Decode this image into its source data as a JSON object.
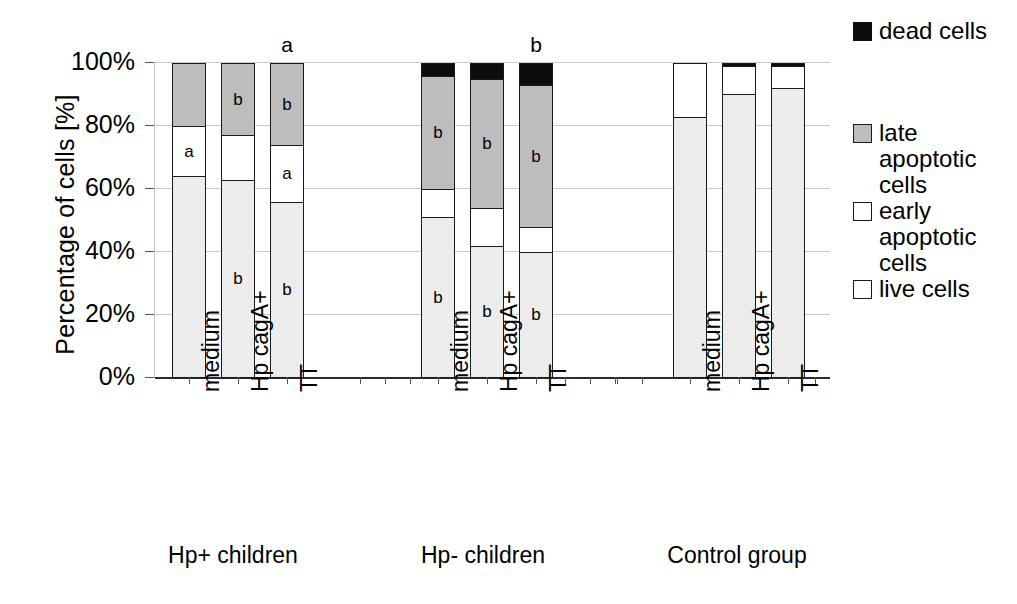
{
  "chart_data": {
    "type": "bar",
    "subtype": "stacked-percent",
    "title": "",
    "xlabel": "",
    "ylabel": "Percentage of cells [%]",
    "ylim": [
      0,
      100
    ],
    "ytick_labels": [
      "0%",
      "20%",
      "40%",
      "60%",
      "80%",
      "100%"
    ],
    "ytick_values": [
      0,
      20,
      40,
      60,
      80,
      100
    ],
    "grid": true,
    "legend_position": "right",
    "categories": [
      "medium",
      "Hp cagA+",
      "TT",
      "medium",
      "Hp cagA+",
      "TT",
      "medium",
      "Hp cagA+",
      "TT"
    ],
    "groups": [
      {
        "label": "Hp+ children",
        "categories": [
          "medium",
          "Hp cagA+",
          "TT"
        ]
      },
      {
        "label": "Hp- children",
        "categories": [
          "medium",
          "Hp cagA+",
          "TT"
        ]
      },
      {
        "label": "Control group",
        "categories": [
          "medium",
          "Hp cagA+",
          "TT"
        ]
      }
    ],
    "series": [
      {
        "name": "live cells",
        "key": "live",
        "color": "#ececec",
        "values": [
          64,
          63,
          56,
          51,
          42,
          40,
          83,
          90,
          92
        ]
      },
      {
        "name": "early apoptotic cells",
        "key": "early",
        "color": "#ffffff",
        "values": [
          16,
          14,
          18,
          9,
          12,
          8,
          17,
          9,
          7
        ]
      },
      {
        "name": "late apoptotic cells",
        "key": "late",
        "color": "#bdbdbd",
        "values": [
          20,
          23,
          26,
          36,
          41,
          45,
          0,
          0,
          0
        ]
      },
      {
        "name": "dead cells",
        "key": "dead",
        "color": "#0d0d0d",
        "values": [
          0,
          0,
          0,
          4,
          5,
          7,
          0,
          1,
          1
        ]
      }
    ],
    "annotations": {
      "bar_top_labels": [
        "",
        "",
        "a",
        "",
        "",
        "b",
        "",
        "",
        ""
      ],
      "in_segment": [
        {
          "bar": 0,
          "segment": "early",
          "text": "a"
        },
        {
          "bar": 1,
          "segment": "late",
          "text": "b"
        },
        {
          "bar": 1,
          "segment": "live",
          "text": "b"
        },
        {
          "bar": 2,
          "segment": "late",
          "text": "b"
        },
        {
          "bar": 2,
          "segment": "early",
          "text": "a"
        },
        {
          "bar": 2,
          "segment": "live",
          "text": "b"
        },
        {
          "bar": 3,
          "segment": "late",
          "text": "b"
        },
        {
          "bar": 3,
          "segment": "live",
          "text": "b"
        },
        {
          "bar": 4,
          "segment": "late",
          "text": "b"
        },
        {
          "bar": 4,
          "segment": "live",
          "text": "b"
        },
        {
          "bar": 5,
          "segment": "late",
          "text": "b"
        },
        {
          "bar": 5,
          "segment": "live",
          "text": "b"
        }
      ]
    }
  },
  "axis": {
    "y_title": "Percentage of cells [%]",
    "ticks": [
      {
        "label": "100%",
        "value": 100
      },
      {
        "label": "80%",
        "value": 80
      },
      {
        "label": "60%",
        "value": 60
      },
      {
        "label": "40%",
        "value": 40
      },
      {
        "label": "20%",
        "value": 20
      },
      {
        "label": "0%",
        "value": 0
      }
    ]
  },
  "bars": [
    {
      "id": "hp-pos-medium",
      "category": "medium",
      "group": "Hp+ children",
      "top_label": "",
      "segments": [
        {
          "key": "dead",
          "pct": 0,
          "sig": ""
        },
        {
          "key": "late",
          "pct": 20,
          "sig": ""
        },
        {
          "key": "early",
          "pct": 16,
          "sig": "a"
        },
        {
          "key": "live",
          "pct": 64,
          "sig": ""
        }
      ]
    },
    {
      "id": "hp-pos-cagA",
      "category": "Hp cagA+",
      "group": "Hp+ children",
      "top_label": "",
      "segments": [
        {
          "key": "dead",
          "pct": 0,
          "sig": ""
        },
        {
          "key": "late",
          "pct": 23,
          "sig": "b"
        },
        {
          "key": "early",
          "pct": 14,
          "sig": ""
        },
        {
          "key": "live",
          "pct": 63,
          "sig": "b"
        }
      ]
    },
    {
      "id": "hp-pos-tt",
      "category": "TT",
      "group": "Hp+ children",
      "top_label": "a",
      "segments": [
        {
          "key": "dead",
          "pct": 0,
          "sig": ""
        },
        {
          "key": "late",
          "pct": 26,
          "sig": "b"
        },
        {
          "key": "early",
          "pct": 18,
          "sig": "a"
        },
        {
          "key": "live",
          "pct": 56,
          "sig": "b"
        }
      ]
    },
    {
      "id": "hp-neg-medium",
      "category": "medium",
      "group": "Hp- children",
      "top_label": "",
      "segments": [
        {
          "key": "dead",
          "pct": 4,
          "sig": ""
        },
        {
          "key": "late",
          "pct": 36,
          "sig": "b"
        },
        {
          "key": "early",
          "pct": 9,
          "sig": ""
        },
        {
          "key": "live",
          "pct": 51,
          "sig": "b"
        }
      ]
    },
    {
      "id": "hp-neg-cagA",
      "category": "Hp cagA+",
      "group": "Hp- children",
      "top_label": "",
      "segments": [
        {
          "key": "dead",
          "pct": 5,
          "sig": ""
        },
        {
          "key": "late",
          "pct": 41,
          "sig": "b"
        },
        {
          "key": "early",
          "pct": 12,
          "sig": ""
        },
        {
          "key": "live",
          "pct": 42,
          "sig": "b"
        }
      ]
    },
    {
      "id": "hp-neg-tt",
      "category": "TT",
      "group": "Hp- children",
      "top_label": "b",
      "segments": [
        {
          "key": "dead",
          "pct": 7,
          "sig": ""
        },
        {
          "key": "late",
          "pct": 45,
          "sig": "b"
        },
        {
          "key": "early",
          "pct": 8,
          "sig": ""
        },
        {
          "key": "live",
          "pct": 40,
          "sig": "b"
        }
      ]
    },
    {
      "id": "control-medium",
      "category": "medium",
      "group": "Control group",
      "top_label": "",
      "segments": [
        {
          "key": "dead",
          "pct": 0,
          "sig": ""
        },
        {
          "key": "late",
          "pct": 0,
          "sig": ""
        },
        {
          "key": "early",
          "pct": 17,
          "sig": ""
        },
        {
          "key": "live",
          "pct": 83,
          "sig": ""
        }
      ]
    },
    {
      "id": "control-cagA",
      "category": "Hp cagA+",
      "group": "Control group",
      "top_label": "",
      "segments": [
        {
          "key": "dead",
          "pct": 1,
          "sig": ""
        },
        {
          "key": "late",
          "pct": 0,
          "sig": ""
        },
        {
          "key": "early",
          "pct": 9,
          "sig": ""
        },
        {
          "key": "live",
          "pct": 90,
          "sig": ""
        }
      ]
    },
    {
      "id": "control-tt",
      "category": "TT",
      "group": "Control group",
      "top_label": "",
      "segments": [
        {
          "key": "dead",
          "pct": 1,
          "sig": ""
        },
        {
          "key": "late",
          "pct": 0,
          "sig": ""
        },
        {
          "key": "early",
          "pct": 7,
          "sig": ""
        },
        {
          "key": "live",
          "pct": 92,
          "sig": ""
        }
      ]
    }
  ],
  "legend": {
    "entries": [
      {
        "key": "dead",
        "lines": [
          "dead cells"
        ]
      },
      {
        "key": "late",
        "lines": [
          "late",
          "apoptotic",
          "cells"
        ]
      },
      {
        "key": "early",
        "lines": [
          "early",
          "apoptotic",
          "cells"
        ]
      },
      {
        "key": "live",
        "lines": [
          "live cells"
        ]
      }
    ]
  },
  "group_labels": [
    "Hp+ children",
    "Hp- children",
    "Control group"
  ]
}
